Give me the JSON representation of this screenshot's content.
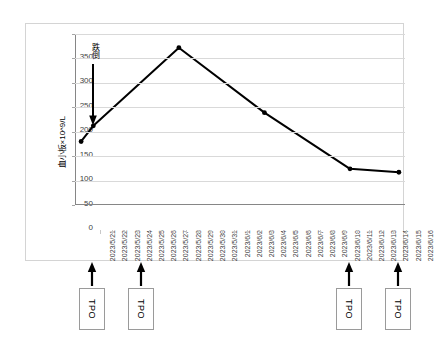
{
  "chart_data": {
    "type": "line",
    "title": "",
    "xlabel": "",
    "ylabel": "血小板×10^9/L",
    "ylim": [
      0,
      350
    ],
    "ytick_values": [
      0,
      50,
      100,
      150,
      200,
      250,
      300,
      350
    ],
    "ytick_labels": [
      "0",
      "50",
      "100",
      "150",
      "200",
      "250",
      "300",
      "350"
    ],
    "grid": true,
    "legend": "none",
    "categories": [
      "2023/5/21",
      "2023/5/22",
      "2023/5/23",
      "2023/5/24",
      "2023/5/25",
      "2023/5/26",
      "2023/5/27",
      "2023/5/28",
      "2023/5/29",
      "2023/5/30",
      "2023/5/31",
      "2023/6/1",
      "2023/6/2",
      "2023/6/3",
      "2023/6/4",
      "2023/6/5",
      "2023/6/6",
      "2023/6/7",
      "2023/6/8",
      "2023/6/9",
      "2023/6/10",
      "2023/6/11",
      "2023/6/12",
      "2023/6/13",
      "2023/6/14",
      "2023/6/15",
      "2023/6/16"
    ],
    "series": [
      {
        "name": "血小板",
        "x": [
          "2023/5/21",
          "2023/5/22",
          "2023/5/29",
          "2023/6/5",
          "2023/6/12",
          "2023/6/16"
        ],
        "values": [
          130,
          162,
          322,
          189,
          74,
          67
        ],
        "marker": "dot",
        "color": "#000000"
      }
    ],
    "annotations": [
      {
        "name": "fall-event",
        "label": "跌倒",
        "at_category": "2023/5/22",
        "arrow": "down",
        "from_value": 288,
        "to_value": 162
      }
    ],
    "treatment_markers": [
      {
        "label": "TPO",
        "at_category": "2023/5/22"
      },
      {
        "label": "TPO",
        "at_category": "2023/5/26"
      },
      {
        "label": "TPO",
        "at_category": "2023/6/12"
      },
      {
        "label": "TPO",
        "at_category": "2023/6/16"
      }
    ]
  },
  "colors": {
    "line": "#000000",
    "grid": "#d9d9d9",
    "axis": "#868686",
    "frame": "#d4d4d4",
    "tick_text": "#3f3f3f",
    "box_border": "#9a9a9a"
  }
}
